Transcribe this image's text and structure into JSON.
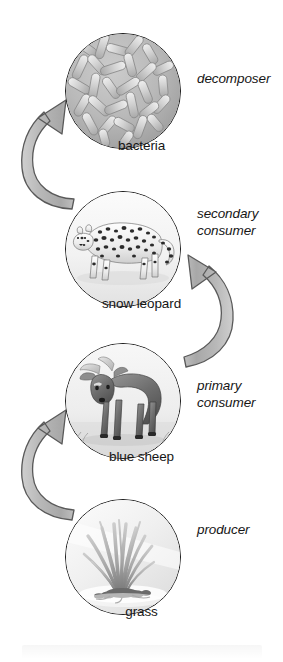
{
  "diagram": {
    "type": "cycle-diagram",
    "colors": {
      "arrow_fill": "#b3b3b3",
      "arrow_stroke": "#4d4d4d",
      "circle_stroke": "#1a1a1a",
      "text": "#161616",
      "background": "#ffffff"
    },
    "nodes": [
      {
        "id": "bacteria",
        "name": "bacteria",
        "role": "decomposer",
        "icon": "bacteria-circle-icon",
        "circle": {
          "cx": 122,
          "cy": 90,
          "r": 57
        },
        "caption_y": 145,
        "role_x": 197,
        "role_y": 78,
        "role_lines": [
          "decomposer"
        ]
      },
      {
        "id": "snow-leopard",
        "name": "snow leopard",
        "role": "secondary consumer",
        "icon": "snow-leopard-circle-icon",
        "circle": {
          "cx": 122,
          "cy": 248,
          "r": 57
        },
        "caption_y": 303,
        "role_x": 197,
        "role_y": 212,
        "role_lines": [
          "secondary",
          "consumer"
        ]
      },
      {
        "id": "blue-sheep",
        "name": "blue sheep",
        "role": "primary consumer",
        "icon": "blue-sheep-circle-icon",
        "circle": {
          "cx": 122,
          "cy": 400,
          "r": 57
        },
        "caption_y": 456,
        "role_x": 197,
        "role_y": 384,
        "role_lines": [
          "primary",
          "consumer"
        ]
      },
      {
        "id": "grass",
        "name": "grass",
        "role": "producer",
        "icon": "grass-circle-icon",
        "circle": {
          "cx": 122,
          "cy": 556,
          "r": 57
        },
        "caption_y": 611,
        "role_x": 197,
        "role_y": 528,
        "role_lines": [
          "producer"
        ]
      }
    ],
    "arrows": [
      {
        "id": "arrow-grass-to-blue-sheep",
        "from": "grass",
        "to": "blue sheep",
        "side": "left",
        "direction": "up"
      },
      {
        "id": "arrow-blue-sheep-to-snow-leopard",
        "from": "blue sheep",
        "to": "snow leopard",
        "side": "right",
        "direction": "up"
      },
      {
        "id": "arrow-snow-leopard-to-bacteria",
        "from": "snow leopard",
        "to": "bacteria",
        "side": "left",
        "direction": "up"
      }
    ]
  }
}
